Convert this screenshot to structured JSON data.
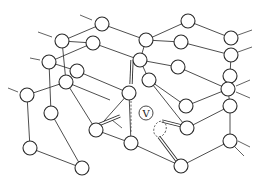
{
  "diagram": {
    "title": "",
    "vacancy_label": "V",
    "atoms": [
      {
        "id": "a1",
        "x": 102,
        "y": 24
      },
      {
        "id": "a2",
        "x": 62,
        "y": 41
      },
      {
        "id": "a3",
        "x": 93,
        "y": 43
      },
      {
        "id": "a4",
        "x": 49,
        "y": 62
      },
      {
        "id": "a5",
        "x": 77,
        "y": 71
      },
      {
        "id": "a6",
        "x": 66,
        "y": 82
      },
      {
        "id": "a7",
        "x": 27,
        "y": 95
      },
      {
        "id": "a8",
        "x": 51,
        "y": 113
      },
      {
        "id": "a9",
        "x": 96,
        "y": 130
      },
      {
        "id": "a10",
        "x": 30,
        "y": 148
      },
      {
        "id": "a11",
        "x": 82,
        "y": 168
      },
      {
        "id": "a12",
        "x": 188,
        "y": 21
      },
      {
        "id": "a13",
        "x": 146,
        "y": 40
      },
      {
        "id": "a14",
        "x": 181,
        "y": 42
      },
      {
        "id": "a15",
        "x": 231,
        "y": 38
      },
      {
        "id": "a16",
        "x": 231,
        "y": 55
      },
      {
        "id": "a17",
        "x": 140,
        "y": 60
      },
      {
        "id": "a18",
        "x": 178,
        "y": 67
      },
      {
        "id": "a19",
        "x": 149,
        "y": 80
      },
      {
        "id": "a20",
        "x": 230,
        "y": 76
      },
      {
        "id": "a21",
        "x": 228,
        "y": 89
      },
      {
        "id": "a22",
        "x": 129,
        "y": 93
      },
      {
        "id": "a23",
        "x": 186,
        "y": 106
      },
      {
        "id": "a24",
        "x": 230,
        "y": 106
      },
      {
        "id": "a25",
        "x": 187,
        "y": 128
      },
      {
        "id": "a26",
        "x": 131,
        "y": 143
      },
      {
        "id": "a27",
        "x": 230,
        "y": 141
      },
      {
        "id": "a28",
        "x": 181,
        "y": 166
      }
    ],
    "vacancy": {
      "x": 146,
      "y": 113
    },
    "interstitial": {
      "x": 160,
      "y": 128
    }
  }
}
